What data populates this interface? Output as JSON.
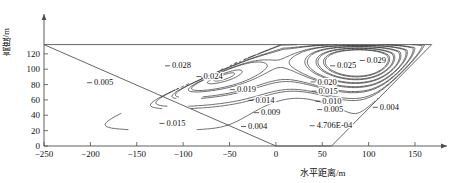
{
  "figure": {
    "type": "contour-plot",
    "background": "#ffffff",
    "line_color": "#1a1a1a",
    "axis_color": "#4d4d4d"
  },
  "axes": {
    "x": {
      "title": "水平距离/m",
      "ticks": [
        "-250",
        "-200",
        "-150",
        "-100",
        "-50",
        "0",
        "50",
        "100",
        "150"
      ],
      "tick_values": [
        -250,
        -200,
        -150,
        -100,
        -50,
        0,
        50,
        100,
        150
      ],
      "range": [
        -250,
        170
      ]
    },
    "y": {
      "title": "高度/m",
      "ticks": [
        "0",
        "20",
        "40",
        "60",
        "80",
        "100",
        "120"
      ],
      "tick_values": [
        0,
        20,
        40,
        60,
        80,
        100,
        120
      ],
      "range": [
        0,
        138
      ]
    }
  },
  "labels": {
    "left_cell": [
      {
        "text": "0.028",
        "x": -112,
        "y": 101
      },
      {
        "text": "0.024",
        "x": -78,
        "y": 87
      },
      {
        "text": "0.019",
        "x": -42,
        "y": 70
      },
      {
        "text": "0.014",
        "x": -22,
        "y": 56
      },
      {
        "text": "0.009",
        "x": -16,
        "y": 40
      },
      {
        "text": "0.015",
        "x": -118,
        "y": 26
      },
      {
        "text": "0.004",
        "x": -30,
        "y": 22
      },
      {
        "text": "0.005",
        "x": -196,
        "y": 79
      }
    ],
    "right_cell": [
      {
        "text": "0.029",
        "x": 98,
        "y": 108
      },
      {
        "text": "0.025",
        "x": 66,
        "y": 101
      },
      {
        "text": "0.020",
        "x": 45,
        "y": 80
      },
      {
        "text": "0.015",
        "x": 46,
        "y": 68
      },
      {
        "text": "0.010",
        "x": 50,
        "y": 55
      },
      {
        "text": "0.005",
        "x": 52,
        "y": 44
      },
      {
        "text": "0.004",
        "x": 112,
        "y": 47
      },
      {
        "text": "4.706E-04",
        "x": 44,
        "y": 23
      }
    ]
  },
  "chart_data": {
    "type": "contour",
    "title": "",
    "xlabel": "水平距离/m",
    "ylabel": "高度/m",
    "xlim": [
      -250,
      170
    ],
    "ylim": [
      0,
      138
    ],
    "grid": false,
    "legend": "none",
    "units": "dimensionless",
    "domain_boundary": {
      "description": "Trapezoidal valley cross-section; flat top at 132 m, left slope from (-250,132) to (0,0), right slope from (60,0) to (168,132)",
      "vertices": [
        [
          -250,
          132
        ],
        [
          168,
          132
        ],
        [
          60,
          0
        ],
        [
          0,
          0
        ]
      ]
    },
    "contour_levels": [
      0.0004706,
      0.004,
      0.005,
      0.009,
      0.01,
      0.014,
      0.015,
      0.019,
      0.02,
      0.024,
      0.025,
      0.028,
      0.029
    ],
    "labeled_levels": [
      "4.706E-04",
      "0.004",
      "0.005",
      "0.009",
      "0.010",
      "0.014",
      "0.015",
      "0.019",
      "0.020",
      "0.024",
      "0.025",
      "0.028",
      "0.029"
    ],
    "extrema": [
      {
        "kind": "maximum",
        "label": "left cell core",
        "x": -110,
        "y": 105,
        "value": 0.03
      },
      {
        "kind": "maximum",
        "label": "right cell core",
        "x": 88,
        "y": 110,
        "value": 0.03
      },
      {
        "kind": "minimum",
        "label": "saddle / near-zero zone",
        "x": 30,
        "y": 20,
        "value": 0.0004706
      }
    ],
    "series": [
      {
        "name": "left cell",
        "peak_value": 0.028,
        "peak_x": -110,
        "peak_y": 103
      },
      {
        "name": "right cell",
        "peak_value": 0.029,
        "peak_x": 90,
        "peak_y": 110
      }
    ]
  }
}
